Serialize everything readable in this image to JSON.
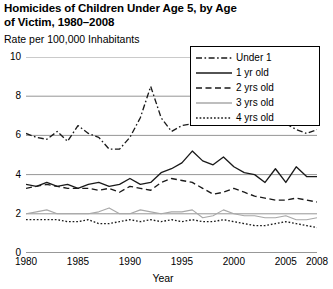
{
  "chart_data": {
    "type": "line",
    "title": "Homicides of Children Under Age 5, by Age of Victim, 1980–2008",
    "ylabel": "Rate per 100,000 Inhabitants",
    "xlabel": "Year",
    "ylim": [
      0,
      10
    ],
    "xlim": [
      1980,
      2008
    ],
    "grid": true,
    "legend_position": "top-right",
    "ytick_labels": [
      "0",
      "2",
      "4",
      "6",
      "8",
      "10"
    ],
    "ytick_values": [
      0,
      2,
      4,
      6,
      8,
      10
    ],
    "xtick_labels": [
      "1980",
      "1985",
      "1990",
      "1995",
      "2000",
      "2005",
      "2008"
    ],
    "xtick_values": [
      1980,
      1985,
      1990,
      1995,
      2000,
      2005,
      2008
    ],
    "x": [
      1980,
      1981,
      1982,
      1983,
      1984,
      1985,
      1986,
      1987,
      1988,
      1989,
      1990,
      1991,
      1992,
      1993,
      1994,
      1995,
      1996,
      1997,
      1998,
      1999,
      2000,
      2001,
      2002,
      2003,
      2004,
      2005,
      2006,
      2007,
      2008
    ],
    "series": [
      {
        "name": "Under 1",
        "style": "dash-dot",
        "color": "#1a1a1a",
        "values": [
          6.1,
          5.9,
          5.8,
          6.2,
          5.7,
          6.5,
          6.1,
          5.9,
          5.3,
          5.3,
          5.9,
          6.9,
          8.5,
          6.9,
          6.2,
          6.5,
          6.6,
          6.6,
          6.6,
          7.1,
          7.3,
          7.6,
          8.1,
          7.3,
          6.9,
          6.6,
          6.3,
          6.1,
          6.3
        ]
      },
      {
        "name": "1 yr old",
        "style": "solid",
        "color": "#1a1a1a",
        "values": [
          3.5,
          3.4,
          3.6,
          3.4,
          3.5,
          3.3,
          3.5,
          3.6,
          3.4,
          3.5,
          3.8,
          3.5,
          3.6,
          4.1,
          4.3,
          4.6,
          5.2,
          4.7,
          4.5,
          4.9,
          4.4,
          4.1,
          4.0,
          3.6,
          4.3,
          3.6,
          4.4,
          3.9,
          3.9
        ]
      },
      {
        "name": "2 yrs old",
        "style": "dash",
        "color": "#1a1a1a",
        "values": [
          3.3,
          3.4,
          3.5,
          3.4,
          3.3,
          3.3,
          3.3,
          3.2,
          3.3,
          3.1,
          3.4,
          3.3,
          3.2,
          3.6,
          3.8,
          3.7,
          3.6,
          3.3,
          3.0,
          3.1,
          3.3,
          3.1,
          2.9,
          2.8,
          2.7,
          2.7,
          2.8,
          2.7,
          2.6
        ]
      },
      {
        "name": "3 yrs old",
        "style": "solid-light",
        "color": "#a8a8a8",
        "values": [
          2.0,
          2.1,
          2.2,
          2.0,
          2.0,
          2.0,
          2.0,
          2.1,
          2.3,
          2.0,
          2.0,
          2.2,
          2.1,
          2.0,
          2.1,
          2.1,
          2.2,
          1.8,
          1.9,
          2.2,
          2.0,
          1.9,
          1.9,
          1.8,
          1.8,
          1.9,
          1.7,
          1.7,
          1.8
        ]
      },
      {
        "name": "4 yrs old",
        "style": "dot",
        "color": "#1a1a1a",
        "values": [
          1.7,
          1.7,
          1.7,
          1.7,
          1.6,
          1.6,
          1.7,
          1.5,
          1.5,
          1.6,
          1.7,
          1.6,
          1.7,
          1.6,
          1.7,
          1.6,
          1.7,
          1.6,
          1.6,
          1.7,
          1.6,
          1.5,
          1.4,
          1.4,
          1.5,
          1.6,
          1.5,
          1.4,
          1.3
        ]
      }
    ]
  }
}
